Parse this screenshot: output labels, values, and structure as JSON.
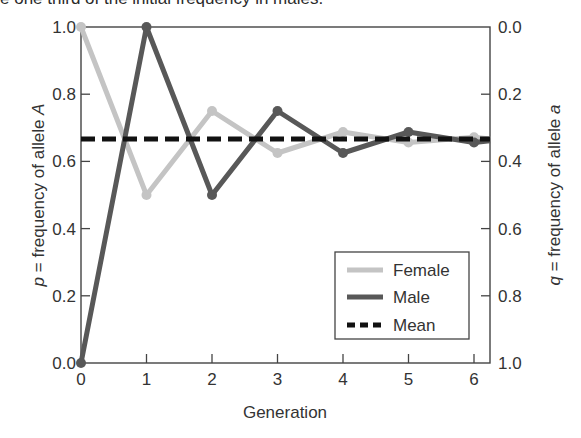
{
  "caption": "e one third of the initial frequency in males.",
  "chart_data": {
    "type": "line",
    "title": "",
    "xlabel": "Generation",
    "ylabel_left": {
      "var": "p",
      "text": " = frequency of allele ",
      "allele": "A"
    },
    "ylabel_right": {
      "var": "q",
      "text": " = frequency of allele ",
      "allele": "a"
    },
    "x": [
      0,
      1,
      2,
      3,
      4,
      5,
      6
    ],
    "xlim": [
      0,
      6.25
    ],
    "ylim_left": [
      0.0,
      1.0
    ],
    "ylim_right": [
      1.0,
      0.0
    ],
    "x_ticks": [
      "0",
      "1",
      "2",
      "3",
      "4",
      "5",
      "6"
    ],
    "y_ticks_left": [
      "0.0",
      "0.2",
      "0.4",
      "0.6",
      "0.8",
      "1.0"
    ],
    "y_ticks_right": [
      "1.0",
      "0.8",
      "0.6",
      "0.4",
      "0.2",
      "0.0"
    ],
    "grid": false,
    "legend_position": "lower right",
    "series": [
      {
        "name": "Female",
        "color": "#c4c4c4",
        "style": "solid",
        "markers": true,
        "values": [
          1.0,
          0.5,
          0.75,
          0.625,
          0.6875,
          0.65625,
          0.671875
        ]
      },
      {
        "name": "Male",
        "color": "#585858",
        "style": "solid",
        "markers": true,
        "values": [
          0.0,
          1.0,
          0.5,
          0.75,
          0.625,
          0.6875,
          0.65625
        ]
      },
      {
        "name": "Mean",
        "color": "#111111",
        "style": "dashed",
        "markers": false,
        "values": [
          0.6667,
          0.6667,
          0.6667,
          0.6667,
          0.6667,
          0.6667,
          0.6667
        ]
      }
    ]
  },
  "legend": {
    "items": [
      {
        "label": "Female"
      },
      {
        "label": "Male"
      },
      {
        "label": "Mean"
      }
    ]
  }
}
